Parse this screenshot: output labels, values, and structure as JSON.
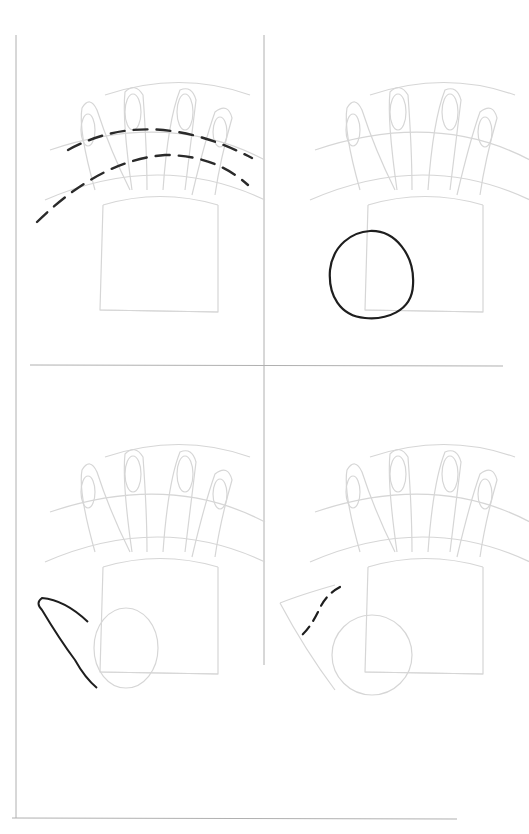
{
  "page": {
    "title": ""
  },
  "colors": {
    "background": "#ffffff",
    "frame": "#a8a8a8",
    "guide": "#d4d4d4",
    "ink": "#222222"
  },
  "panels": [
    {
      "step": 1,
      "name": "knuckle-arc-guides",
      "ink_feature": "two dashed arcs across fingers"
    },
    {
      "step": 2,
      "name": "thumb-base-circle",
      "ink_feature": "circle at lower-left of palm"
    },
    {
      "step": 3,
      "name": "thumb-outline",
      "ink_feature": "curved thumb shape"
    },
    {
      "step": 4,
      "name": "thumb-joint-line",
      "ink_feature": "dashed line at thumb base"
    }
  ]
}
